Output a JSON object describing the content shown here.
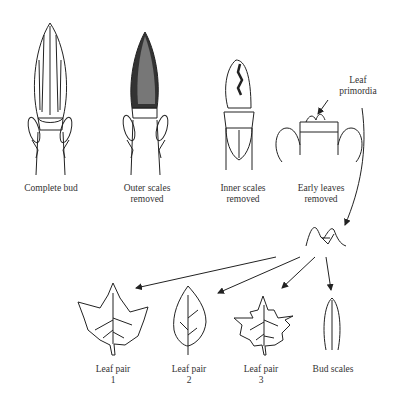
{
  "figure": {
    "stages": [
      {
        "label_line1": "Complete bud",
        "label_line2": ""
      },
      {
        "label_line1": "Outer scales",
        "label_line2": "removed"
      },
      {
        "label_line1": "Inner scales",
        "label_line2": "removed"
      },
      {
        "label_line1": "Early leaves",
        "label_line2": "removed"
      }
    ],
    "annotation": {
      "line1": "Leaf",
      "line2": "primordia"
    },
    "products": [
      {
        "line1": "Leaf pair",
        "line2": "1"
      },
      {
        "line1": "Leaf pair",
        "line2": "2"
      },
      {
        "line1": "Leaf pair",
        "line2": "3"
      },
      {
        "line1": "Bud scales",
        "line2": ""
      }
    ]
  }
}
